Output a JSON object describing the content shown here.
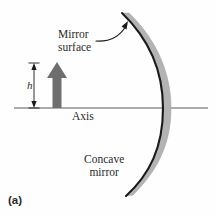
{
  "figure": {
    "panel_label": "(a)",
    "background_color": "#fefefe",
    "width": 216,
    "height": 216
  },
  "labels": {
    "mirror_surface": "Mirror\nsurface",
    "axis": "Axis",
    "concave_mirror": "Concave\nmirror",
    "height_symbol": "h"
  },
  "colors": {
    "ink": "#2b2b2b",
    "mirror_fill": "#b3b3b3",
    "mirror_edge": "#1a1a1a",
    "object_arrow": "#6e6e6e",
    "axis_line": "#5a5a5a",
    "dimension_line": "#1a1a1a",
    "pointer_arrow": "#1a1a1a"
  },
  "geometry": {
    "axis": {
      "x1": 14,
      "y1": 108,
      "x2": 208,
      "y2": 108
    },
    "mirror": {
      "vertex_x": 160,
      "vertex_y": 108,
      "top_end": {
        "x": 122,
        "y": 13
      },
      "bottom_end": {
        "x": 126,
        "y": 196
      },
      "thickness": 9
    },
    "object_arrow": {
      "base_x": 57,
      "base_y": 108,
      "tip_y": 62,
      "shaft_half_width": 4.5,
      "head_half_width": 10,
      "head_height": 16
    },
    "height_dimension": {
      "x": 34,
      "top_y": 63,
      "bottom_y": 108
    },
    "pointer": {
      "start": {
        "x": 96,
        "y": 41
      },
      "control": {
        "x": 112,
        "y": 40
      },
      "end": {
        "x": 127,
        "y": 24
      }
    }
  }
}
